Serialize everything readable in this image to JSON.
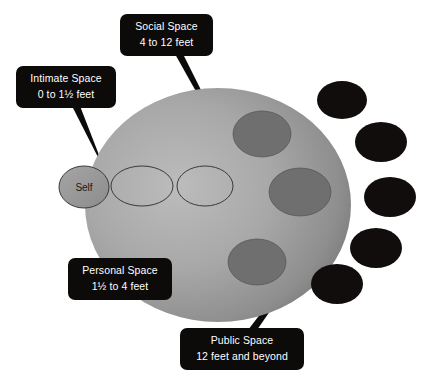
{
  "diagram": {
    "self_label": "Self",
    "colors": {
      "callout_bg": "#0d0a0a",
      "callout_text": "#ffffff",
      "field_light": "#b6b6b6",
      "field_mid": "#9d9d9d",
      "field_dark": "#6f6f6f",
      "person_dark": "#6a6a6a",
      "person_black": "#110d0d",
      "self_fill": "#9a9a9a",
      "outline": "#2b2b2b",
      "background": "#ffffff"
    },
    "callouts": [
      {
        "id": "social-space",
        "line1": "Social Space",
        "line2": "4 to 12 feet",
        "box": {
          "x": 120,
          "y": 14,
          "w": 93,
          "h": 42
        },
        "pointer": {
          "x1": 175,
          "y1": 54,
          "x2": 183,
          "y2": 54,
          "tipx": 249,
          "tipy": 186
        }
      },
      {
        "id": "intimate-space",
        "line1": "Intimate Space",
        "line2": "0 to 1½ feet",
        "box": {
          "x": 16,
          "y": 66,
          "w": 100,
          "h": 42
        },
        "pointer": {
          "x1": 72,
          "y1": 106,
          "x2": 80,
          "y2": 106,
          "tipx": 106,
          "tipy": 173
        }
      },
      {
        "id": "personal-space",
        "line1": "Personal Space",
        "line2": "1½ to 4 feet",
        "box": {
          "x": 68,
          "y": 258,
          "w": 104,
          "h": 42
        },
        "pointer": {
          "x1": 122,
          "y1": 260,
          "x2": 131,
          "y2": 260,
          "tipx": 179,
          "tipy": 200
        }
      },
      {
        "id": "public-space",
        "line1": "Public Space",
        "line2": "12 feet and beyond",
        "box": {
          "x": 180,
          "y": 328,
          "w": 124,
          "h": 42
        },
        "pointer": {
          "x1": 248,
          "y1": 330,
          "x2": 257,
          "y2": 330,
          "tipx": 337,
          "tipy": 214
        }
      }
    ],
    "field_ellipse": {
      "cx": 218,
      "cy": 205,
      "rx": 133,
      "ry": 117
    },
    "self_ellipse": {
      "cx": 84,
      "cy": 187,
      "rx": 25,
      "ry": 21
    },
    "ring_ellipses": [
      {
        "id": "personal-ring",
        "cx": 142,
        "cy": 186,
        "rx": 31,
        "ry": 20
      },
      {
        "id": "social-ring",
        "cx": 205,
        "cy": 186,
        "rx": 28,
        "ry": 20
      }
    ],
    "gray_people": [
      {
        "id": "person-gray-1",
        "cx": 262,
        "cy": 134,
        "rx": 29,
        "ry": 23
      },
      {
        "id": "person-gray-2",
        "cx": 300,
        "cy": 192,
        "rx": 31,
        "ry": 24
      },
      {
        "id": "person-gray-3",
        "cx": 257,
        "cy": 262,
        "rx": 29,
        "ry": 23
      }
    ],
    "black_people": [
      {
        "id": "person-black-1",
        "cx": 342,
        "cy": 100,
        "rx": 25,
        "ry": 19
      },
      {
        "id": "person-black-2",
        "cx": 381,
        "cy": 142,
        "rx": 26,
        "ry": 20
      },
      {
        "id": "person-black-3",
        "cx": 390,
        "cy": 197,
        "rx": 26,
        "ry": 20
      },
      {
        "id": "person-black-4",
        "cx": 376,
        "cy": 248,
        "rx": 26,
        "ry": 20
      },
      {
        "id": "person-black-5",
        "cx": 337,
        "cy": 284,
        "rx": 26,
        "ry": 20
      }
    ]
  }
}
